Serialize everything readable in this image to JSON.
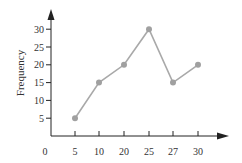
{
  "chart_data": {
    "type": "line",
    "title": "",
    "xlabel": "",
    "ylabel": "Frequency",
    "origin_label": "0",
    "categories": [
      "5",
      "10",
      "20",
      "25",
      "27",
      "30"
    ],
    "series": [
      {
        "name": "Frequency",
        "values": [
          5,
          15,
          20,
          30,
          15,
          20
        ]
      }
    ],
    "y_ticks": [
      5,
      10,
      15,
      20,
      25,
      30
    ],
    "ylim": [
      0,
      30
    ],
    "grid": false,
    "legend": "none",
    "colors": {
      "line": "#a9a9a9",
      "marker": "#a0a0a0",
      "axis": "#222222"
    }
  }
}
